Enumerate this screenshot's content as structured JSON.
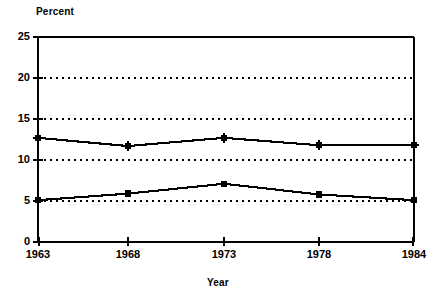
{
  "chart_data": {
    "type": "line",
    "title": "",
    "xlabel": "Year",
    "ylabel": "Percent",
    "x": [
      1963,
      1968,
      1973,
      1978,
      1984
    ],
    "xtick_labels": [
      "1963",
      "1968",
      "1973",
      "1978",
      "1984"
    ],
    "ytick_labels": [
      "0",
      "5",
      "10",
      "15",
      "20",
      "25"
    ],
    "ytick_values": [
      0,
      5,
      10,
      15,
      20,
      25
    ],
    "ylim": [
      0,
      25
    ],
    "xlim": [
      1963,
      1984
    ],
    "grid": "horizontal-dotted",
    "legend": "none",
    "series": [
      {
        "name": "upper-series",
        "marker": "star",
        "values": [
          12.7,
          11.7,
          12.7,
          11.8,
          11.8
        ]
      },
      {
        "name": "lower-series",
        "marker": "square",
        "values": [
          5.1,
          5.9,
          7.1,
          5.8,
          5.1
        ]
      }
    ],
    "colors": {
      "line": "#000000",
      "marker": "#000000",
      "grid": "#000000",
      "axis": "#000000",
      "background": "#ffffff"
    }
  }
}
